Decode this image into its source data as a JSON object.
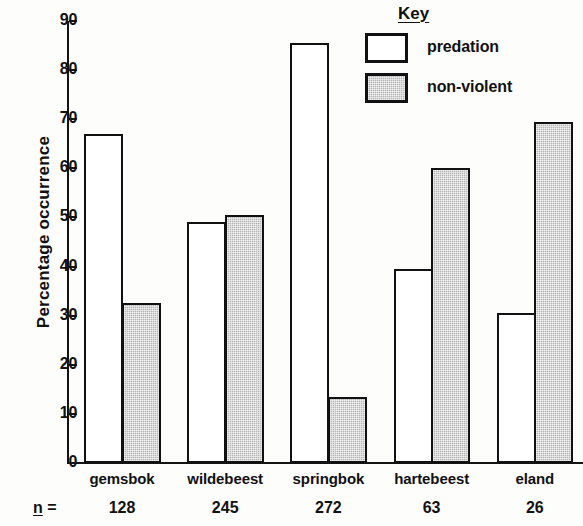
{
  "chart_data": {
    "type": "bar",
    "title": "",
    "xlabel": "",
    "ylabel": "Percentage  occurrence",
    "ylim": [
      0,
      90
    ],
    "yticks": [
      0,
      10,
      20,
      30,
      40,
      50,
      60,
      70,
      80,
      90
    ],
    "ytick_labels": [
      "0",
      "10",
      "20",
      "30",
      "40",
      "50",
      "60",
      "70",
      "80",
      "90"
    ],
    "grid": false,
    "legend_position": "top-right",
    "categories": [
      "gemsbok",
      "wildebeest",
      "springbok",
      "hartebeest",
      "eland"
    ],
    "sample_sizes": [
      "128",
      "245",
      "272",
      "63",
      "26"
    ],
    "sample_size_prefix_symbol": "n",
    "sample_size_prefix_equals": "=",
    "series": [
      {
        "name": "predation",
        "fill": "white",
        "values": [
          67,
          49,
          85.5,
          39.5,
          30.5
        ]
      },
      {
        "name": "non-violent",
        "fill": "#b4b4b4",
        "values": [
          32.5,
          50.5,
          13.5,
          60,
          69.5
        ]
      }
    ]
  },
  "legend": {
    "title": "Key",
    "entries": [
      {
        "label": "predation",
        "swatch": "white-box"
      },
      {
        "label": "non-violent",
        "swatch": "gray-stippled-box"
      }
    ]
  },
  "colors": {
    "axis": "#141414",
    "bar_outline": "#111111",
    "predation_fill": "#ffffff",
    "nonviolent_fill": "#b4b4b4",
    "background": "#fdfdfc"
  }
}
